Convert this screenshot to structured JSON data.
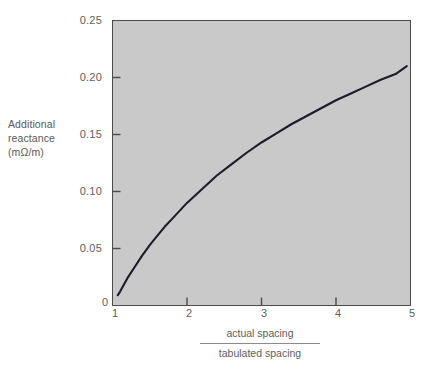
{
  "chart_data": {
    "type": "line",
    "title": "",
    "xlabel_numerator": "actual spacing",
    "xlabel_denominator": "tabulated spacing",
    "ylabel_lines": [
      "Additional",
      "reactance",
      "(mΩ/m)"
    ],
    "xlim": [
      1,
      5
    ],
    "ylim": [
      0,
      0.25
    ],
    "xticks": [
      "1",
      "2",
      "3",
      "4",
      "5"
    ],
    "yticks": [
      "0",
      "0.05",
      "0.10",
      "0.15",
      "0.20",
      "0.25"
    ],
    "grid": false,
    "legend": "none",
    "plot_background": "#c9c9c9",
    "line_color": "#1c1c28",
    "series": [
      {
        "name": "additional reactance",
        "x": [
          1.07,
          1.1,
          1.15,
          1.2,
          1.3,
          1.4,
          1.5,
          1.6,
          1.7,
          1.8,
          1.9,
          2.0,
          2.2,
          2.4,
          2.6,
          2.8,
          3.0,
          3.2,
          3.4,
          3.6,
          3.8,
          4.0,
          4.2,
          4.4,
          4.6,
          4.8,
          4.95
        ],
        "y": [
          0.009,
          0.012,
          0.018,
          0.024,
          0.034,
          0.044,
          0.053,
          0.061,
          0.069,
          0.076,
          0.083,
          0.09,
          0.102,
          0.114,
          0.124,
          0.134,
          0.143,
          0.151,
          0.159,
          0.166,
          0.173,
          0.18,
          0.186,
          0.192,
          0.198,
          0.203,
          0.21
        ]
      }
    ]
  }
}
